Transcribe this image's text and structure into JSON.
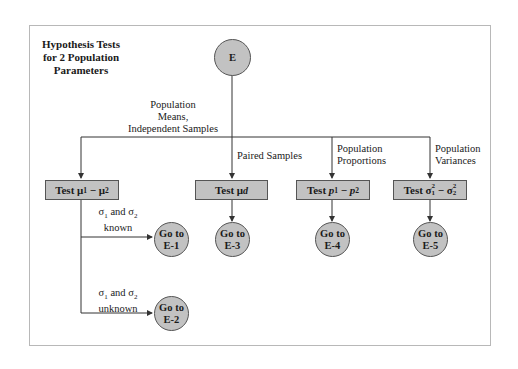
{
  "title": "Hypothesis Tests for 2 Population Parameters",
  "root": {
    "label": "E"
  },
  "branches": [
    {
      "label": "Population Means, Independent Samples",
      "test": {
        "prefix": "Test",
        "expr": "μ1 − μ2"
      }
    },
    {
      "label": "Paired Samples",
      "test": {
        "prefix": "Test",
        "expr": "μd"
      },
      "goto": "Go to E-3"
    },
    {
      "label": "Population Proportions",
      "test": {
        "prefix": "Test",
        "expr": "p1 − p2"
      },
      "goto": "Go to E-4"
    },
    {
      "label": "Population Variances",
      "test": {
        "prefix": "Test",
        "expr": "σ1² − σ2²"
      },
      "goto": "Go to E-5"
    }
  ],
  "sub_branches": [
    {
      "condition": "σ1 and σ2 known",
      "goto": "Go to E-1"
    },
    {
      "condition": "σ1 and σ2 unknown",
      "goto": "Go to E-2"
    }
  ],
  "text": {
    "title_l1": "Hypothesis Tests",
    "title_l2": "for 2 Population",
    "title_l3": "Parameters",
    "root": "E",
    "b1_l1": "Population",
    "b1_l2": "Means,",
    "b1_l3": "Independent Samples",
    "b2": "Paired Samples",
    "b3_l1": "Population",
    "b3_l2": "Proportions",
    "b4_l1": "Population",
    "b4_l2": "Variances",
    "test": "Test",
    "goto": "Go to",
    "e1": "E-1",
    "e2": "E-2",
    "e3": "E-3",
    "e4": "E-4",
    "e5": "E-5",
    "and": "and",
    "known": "known",
    "unknown": "unknown",
    "sigma": "σ",
    "mu": "μ",
    "p": "p",
    "minus": "−",
    "d": "d",
    "one": "1",
    "two": "2"
  },
  "colors": {
    "node_fill": "#c2c2c2",
    "line": "#333333",
    "frame": "#b8b8b8"
  }
}
